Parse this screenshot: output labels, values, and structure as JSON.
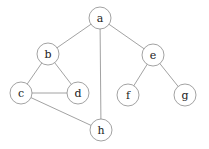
{
  "diagram": {
    "type": "graph",
    "nodes": [
      {
        "id": "a",
        "label": "a",
        "x": 100,
        "y": 18
      },
      {
        "id": "b",
        "label": "b",
        "x": 48,
        "y": 54
      },
      {
        "id": "c",
        "label": "c",
        "x": 21,
        "y": 93
      },
      {
        "id": "d",
        "label": "d",
        "x": 78,
        "y": 93
      },
      {
        "id": "e",
        "label": "e",
        "x": 153,
        "y": 55
      },
      {
        "id": "f",
        "label": "f",
        "x": 128,
        "y": 95
      },
      {
        "id": "g",
        "label": "g",
        "x": 185,
        "y": 95
      },
      {
        "id": "h",
        "label": "h",
        "x": 101,
        "y": 130
      }
    ],
    "edges": [
      [
        "a",
        "b"
      ],
      [
        "a",
        "e"
      ],
      [
        "a",
        "h"
      ],
      [
        "b",
        "c"
      ],
      [
        "b",
        "d"
      ],
      [
        "c",
        "d"
      ],
      [
        "c",
        "h"
      ],
      [
        "e",
        "f"
      ],
      [
        "e",
        "g"
      ]
    ],
    "node_radius": 11,
    "colors": {
      "stroke": "#8a8a8a",
      "fill": "#ffffff",
      "label": "#222222"
    }
  }
}
